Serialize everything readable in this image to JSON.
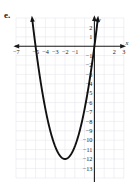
{
  "figure": {
    "label": "e.",
    "axis_x_name": "x",
    "axis_y_name": "y"
  },
  "chart_data": {
    "type": "line",
    "title": "",
    "subtitle": "",
    "xlabel": "x",
    "ylabel": "y",
    "grid": true,
    "legend": null,
    "xlim": [
      -7.6,
      3.6
    ],
    "ylim": [
      -13.6,
      2.6
    ],
    "xticks": [
      -7,
      -5,
      -4,
      -3,
      -2,
      -1,
      2,
      3
    ],
    "xtick_labels": [
      "−7",
      "−5",
      "−4",
      "−3",
      "−2",
      "−1",
      "2",
      "3"
    ],
    "yticks": [
      2,
      1,
      -1,
      -2,
      -3,
      -4,
      -5,
      -6,
      -7,
      -8,
      -9,
      -10,
      -11,
      -12,
      -13
    ],
    "ytick_labels": [
      "2",
      "1",
      "−1",
      "−2",
      "−3",
      "−4",
      "−5",
      "−6",
      "−7",
      "−8",
      "−9",
      "−10",
      "−11",
      "−12",
      "−13"
    ],
    "series": [
      {
        "name": "parabola",
        "curve_type": "parabola",
        "vertex": [
          -3,
          -12
        ],
        "opens": "up",
        "leading_coefficient": 1.33,
        "roots": [
          -6,
          0
        ],
        "y_intercept": 0,
        "arrowheads": [
          "left-end-up",
          "right-end-up"
        ],
        "x": [
          -6.4,
          -6.0,
          -5.5,
          -5.0,
          -4.5,
          -4.0,
          -3.5,
          -3.0,
          -2.5,
          -2.0,
          -1.5,
          -1.0,
          -0.5,
          0.0,
          0.35
        ],
        "y": [
          2.0,
          0.0,
          -4.2,
          -7.3,
          -9.8,
          -11.1,
          -11.8,
          -12.0,
          -11.8,
          -11.1,
          -9.8,
          -7.3,
          -4.2,
          0.0,
          2.0
        ]
      }
    ]
  }
}
